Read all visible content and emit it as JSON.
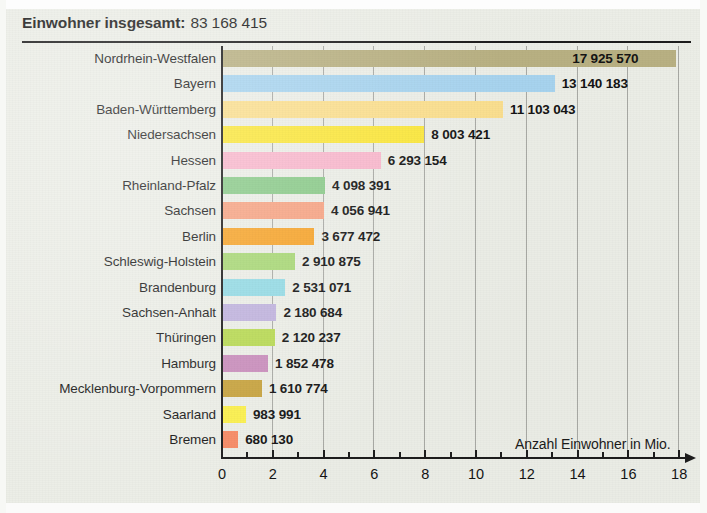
{
  "title": {
    "label": "Einwohner insgesamt:",
    "value": "83 168 415"
  },
  "axis_caption": "Anzahl Einwohner in Mio.",
  "x_ticks": [
    "0",
    "2",
    "4",
    "6",
    "8",
    "10",
    "12",
    "14",
    "16",
    "18"
  ],
  "chart_data": {
    "type": "bar",
    "orientation": "horizontal",
    "xlabel": "Anzahl Einwohner in Mio.",
    "ylabel": "",
    "xlim": [
      0,
      18
    ],
    "xtick_step": 2,
    "xminor_tick_step": 1,
    "grid": true,
    "grid_axis": "x",
    "legend": false,
    "unit": "millions of inhabitants",
    "total": 83168415,
    "categories": [
      "Nordrhein-Westfalen",
      "Bayern",
      "Baden-Württemberg",
      "Niedersachsen",
      "Hessen",
      "Rheinland-Pfalz",
      "Sachsen",
      "Berlin",
      "Schleswig-Holstein",
      "Brandenburg",
      "Sachsen-Anhalt",
      "Thüringen",
      "Hamburg",
      "Mecklenburg-Vorpommern",
      "Saarland",
      "Bremen"
    ],
    "values": [
      17925570,
      13140183,
      11103043,
      8003421,
      6293154,
      4098391,
      4056941,
      3677472,
      2910875,
      2531071,
      2180684,
      2120237,
      1852478,
      1610774,
      983991,
      680130
    ],
    "value_labels": [
      "17 925 570",
      "13 140 183",
      "11 103 043",
      "8 003 421",
      "6 293 154",
      "4 098 391",
      "4 056 941",
      "3 677 472",
      "2 910 875",
      "2 531 071",
      "2 180 684",
      "2 120 237",
      "1 852 478",
      "1 610 774",
      "983 991",
      "680 130"
    ],
    "colors": [
      "#b9b183",
      "#a8d4ef",
      "#fbdf8f",
      "#fbe73e",
      "#f9b8cd",
      "#8ccb8b",
      "#f7a484",
      "#f7a52c",
      "#a9d877",
      "#95dbe5",
      "#c1b4de",
      "#b9da55",
      "#ca8fbd",
      "#c8a440",
      "#fbf04e",
      "#f78b66"
    ]
  }
}
